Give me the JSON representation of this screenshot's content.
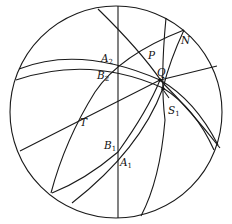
{
  "diagram": {
    "type": "stereographic-projection",
    "primitive_circle": {
      "cx": 116,
      "cy": 112,
      "r": 106
    },
    "stroke_color": "#1a1a1a",
    "background": "#ffffff"
  },
  "labels": {
    "A2": {
      "base": "A",
      "sub": "2"
    },
    "B2": {
      "base": "B",
      "sub": "2"
    },
    "P": {
      "base": "P",
      "sub": ""
    },
    "N": {
      "base": "N",
      "sub": ""
    },
    "Q": {
      "base": "Q",
      "sub": ""
    },
    "S1": {
      "base": "S",
      "sub": "1"
    },
    "T": {
      "base": "T",
      "sub": ""
    },
    "B1": {
      "base": "B",
      "sub": "1"
    },
    "A1": {
      "base": "A",
      "sub": "1"
    }
  },
  "points": {
    "Q": {
      "x": 160,
      "y": 80
    },
    "S1": {
      "x": 163,
      "y": 89
    }
  }
}
